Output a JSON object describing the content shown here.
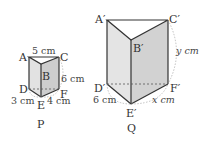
{
  "prism_p": {
    "name": "P",
    "vertices": {
      "A": "A",
      "B": "B",
      "C": "C",
      "D": "D",
      "E": "E",
      "F": "F"
    },
    "dims": {
      "AC": "5 cm",
      "CF": "6 cm",
      "DE": "3 cm",
      "EF": "4 cm"
    }
  },
  "prism_q": {
    "name": "Q",
    "vertices": {
      "A": "A′",
      "B": "B′",
      "C": "C′",
      "D": "D′",
      "E": "E′",
      "F": "F′"
    },
    "dims": {
      "CF": "y cm",
      "DE": "6 cm",
      "EF": "x cm"
    }
  },
  "colors": {
    "face_left": "#e4e4e4",
    "face_right": "#cfcfcf",
    "top": "#ffffff",
    "edge": "#333333",
    "hidden": "#555555"
  }
}
